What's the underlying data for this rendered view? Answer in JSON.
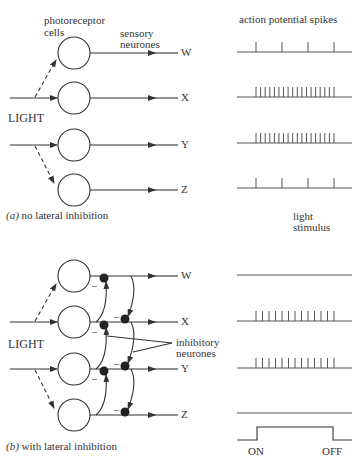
{
  "panel_a": {
    "caption_tag": "(a)",
    "caption_text": "no lateral inhibition",
    "label_photoreceptor_1": "photoreceptor",
    "label_photoreceptor_2": "cells",
    "label_sensory_1": "sensory",
    "label_sensory_2": "neurones",
    "label_light": "LIGHT",
    "outputs": [
      "W",
      "X",
      "Y",
      "Z"
    ],
    "spike_title": "action potential spikes",
    "spike_counts": {
      "W": 4,
      "X": 18,
      "Y": 18,
      "Z": 4
    }
  },
  "panel_b": {
    "caption_tag": "(b)",
    "caption_text": "with lateral inhibition",
    "label_light": "LIGHT",
    "label_inhibitory_1": "inhibitory",
    "label_inhibitory_2": "neurones",
    "inhibition_sign": "–",
    "outputs": [
      "W",
      "X",
      "Y",
      "Z"
    ],
    "spike_counts": {
      "W": 0,
      "X": 13,
      "Y": 13,
      "Z": 0
    }
  },
  "stimulus": {
    "label_1": "light",
    "label_2": "stimulus",
    "on_label": "ON",
    "off_label": "OFF"
  },
  "colors": {
    "line": "#333333",
    "trace": "#555555"
  }
}
